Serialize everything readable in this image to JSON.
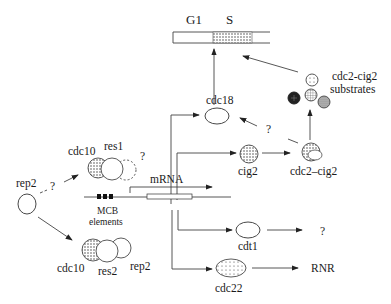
{
  "cell_cycle": {
    "g1_label": "G1",
    "s_label": "S"
  },
  "nodes": {
    "cdc18": "cdc18",
    "cig2": "cig2",
    "cdc2_cig2": "cdc2–cig2",
    "cdc2_cig2_substrates_line1": "cdc2-cig2",
    "cdc2_cig2_substrates_line2": "substrates",
    "cdt1": "cdt1",
    "cdc22": "cdc22",
    "rnr": "RNR",
    "cdt1_target": "?",
    "rep2_free": "rep2",
    "complex1_cdc10": "cdc10",
    "complex1_res1": "res1",
    "complex1_unknown": "?",
    "complex2_cdc10": "cdc10",
    "complex2_res2": "res2",
    "complex2_rep2": "rep2",
    "rep2_to_complex1_question": "?",
    "cdc2cig2_to_cdc18_question": "?",
    "mrna": "mRNA",
    "mcb_line1": "MCB",
    "mcb_line2": "elements"
  },
  "colors": {
    "line": "#444444",
    "stipple": "#888888",
    "dark": "#222222"
  }
}
